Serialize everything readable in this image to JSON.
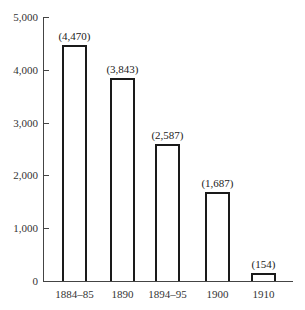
{
  "chart_data": {
    "type": "bar",
    "title": "",
    "xlabel": "",
    "ylabel": "",
    "categories": [
      "1884–85",
      "1890",
      "1894–95",
      "1900",
      "1910"
    ],
    "values": [
      4470,
      3843,
      2587,
      1687,
      154
    ],
    "data_labels": [
      "(4,470)",
      "(3,843)",
      "(2,587)",
      "(1,687)",
      "(154)"
    ],
    "ylim": [
      0,
      5000
    ],
    "yticks": [
      0,
      1000,
      2000,
      3000,
      4000,
      5000
    ],
    "ytick_labels": [
      "0",
      "1,000",
      "2,000",
      "3,000",
      "4,000",
      "5,000"
    ],
    "grid": false,
    "legend": null,
    "bar_fill": "#ffffff",
    "bar_edge": "#1a1a1a"
  }
}
